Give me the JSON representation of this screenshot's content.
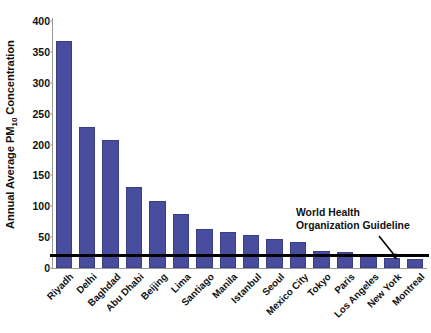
{
  "chart_data": {
    "type": "bar",
    "title": "",
    "xlabel": "",
    "ylabel": "Annual Average PM10 Concentration",
    "ylabel_prefix": "Annual Average PM",
    "ylabel_subscript": "10",
    "ylabel_suffix": " Concentration",
    "ylim": [
      0,
      400
    ],
    "ytick_values": [
      0,
      50,
      100,
      150,
      200,
      250,
      300,
      350,
      400
    ],
    "ytick_labels": [
      "0",
      "50",
      "100",
      "150",
      "200",
      "250",
      "300",
      "350",
      "400"
    ],
    "grid": false,
    "legend": "none",
    "bar_color": "#484d9e",
    "bar_edge_color": "#3a3f85",
    "categories": [
      "Riyadh",
      "Delhi",
      "Baghdad",
      "Abu Dhabi",
      "Beijing",
      "Lima",
      "Santiago",
      "Manila",
      "Istanbul",
      "Seoul",
      "Mexico City",
      "Tokyo",
      "Paris",
      "Los Angeles",
      "New York",
      "Montreal"
    ],
    "values": [
      368,
      229,
      208,
      132,
      108,
      88,
      63,
      58,
      53,
      47,
      42,
      28,
      26,
      23,
      17,
      15
    ],
    "annotations": [
      {
        "name": "who-guideline",
        "text_line1": "World Health",
        "text_line2": "Organization Guideline",
        "value": 20,
        "line_color": "#000000"
      }
    ]
  }
}
